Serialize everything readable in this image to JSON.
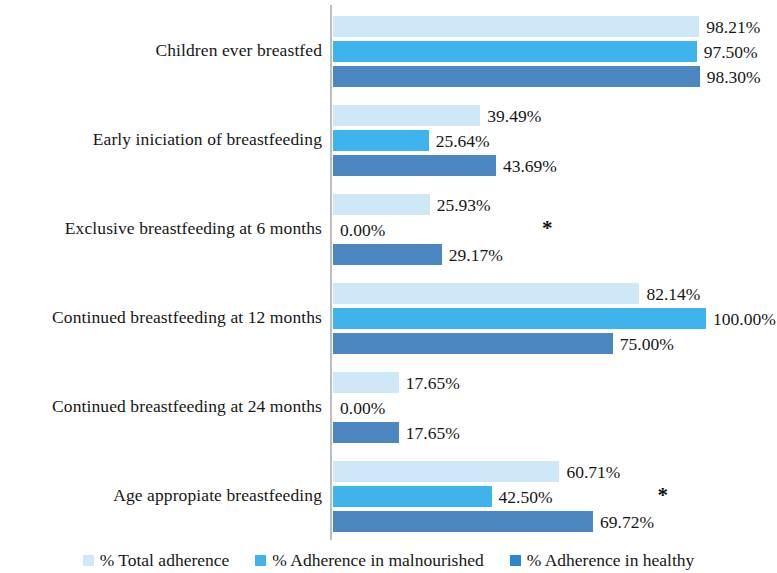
{
  "chart_data": {
    "type": "bar",
    "orientation": "horizontal",
    "title": "",
    "subtitle": "",
    "xlabel": "",
    "ylabel": "",
    "xlim": [
      0,
      100
    ],
    "grid": false,
    "legend_position": "bottom",
    "value_suffix": "%",
    "categories": [
      "Children ever breastfed",
      "Early iniciation of breastfeeding",
      "Exclusive breastfeeding at 6 months",
      "Continued breastfeeding at 12 months",
      "Continued breastfeeding at 24 months",
      "Age appropiate breastfeeding"
    ],
    "series": [
      {
        "name": "% Total adherence",
        "color": "#cfe8f7",
        "values": [
          98.21,
          39.49,
          25.93,
          82.14,
          17.65,
          60.71
        ],
        "labels": [
          "98.21%",
          "39.49%",
          "25.93%",
          "82.14%",
          "17.65%",
          "60.71%"
        ]
      },
      {
        "name": "% Adherence in malnourished",
        "color": "#3fb3ec",
        "values": [
          97.5,
          25.64,
          0.0,
          100.0,
          0.0,
          42.5
        ],
        "labels": [
          "97.50%",
          "25.64%",
          "0.00%",
          "100.00%",
          "0.00%",
          "42.50%"
        ]
      },
      {
        "name": "% Adherence in healthy",
        "color": "#4d87c2",
        "values": [
          98.3,
          43.69,
          29.17,
          75.0,
          17.65,
          69.72
        ],
        "labels": [
          "98.30%",
          "43.69%",
          "29.17%",
          "75.00%",
          "17.65%",
          "69.72%"
        ]
      }
    ],
    "annotations": [
      {
        "text": "*",
        "category": "Exclusive breastfeeding at 6 months",
        "series": "% Adherence in malnourished",
        "x_pct": 56
      },
      {
        "text": "*",
        "category": "Age appropiate breastfeeding",
        "series": "% Adherence in malnourished",
        "x_pct": 87
      }
    ]
  },
  "legend": {
    "items": [
      {
        "label": "% Total adherence"
      },
      {
        "label": "% Adherence in malnourished"
      },
      {
        "label": "% Adherence in healthy"
      }
    ]
  }
}
